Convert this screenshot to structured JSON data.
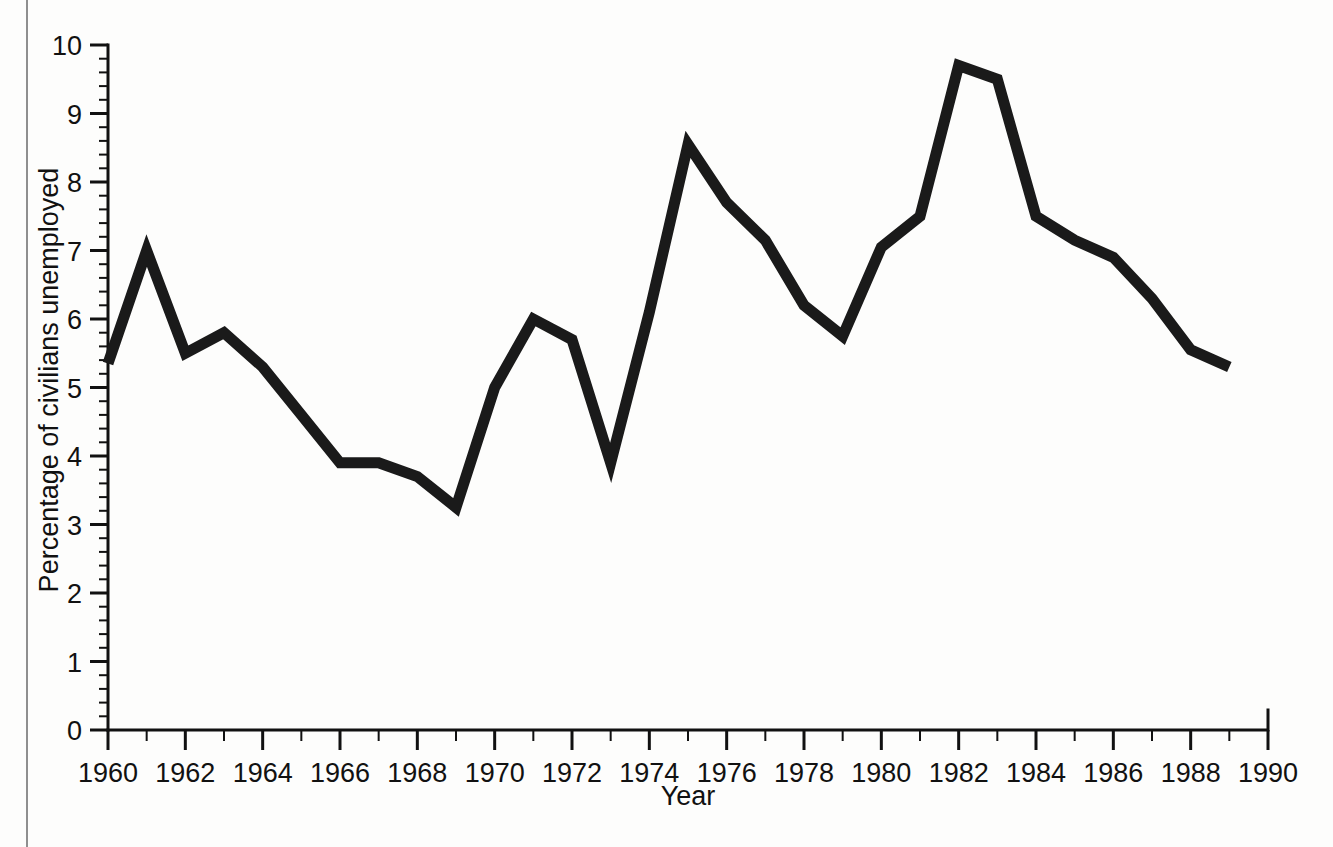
{
  "figure": {
    "background_color": "#fdfdfc",
    "line_color": "#1a1a1a",
    "axis_color": "#111111"
  },
  "chart_data": {
    "type": "line",
    "title": "",
    "xlabel": "Year",
    "ylabel": "Percentage of civilians unemployed",
    "xlim": [
      1960,
      1990
    ],
    "ylim": [
      0,
      10
    ],
    "grid": false,
    "legend": null,
    "x_major_ticks": [
      1960,
      1962,
      1964,
      1966,
      1968,
      1970,
      1972,
      1974,
      1976,
      1978,
      1980,
      1982,
      1984,
      1986,
      1988,
      1990
    ],
    "x_tick_labels": [
      "1960",
      "1962",
      "1964",
      "1966",
      "1968",
      "1970",
      "1972",
      "1974",
      "1976",
      "1978",
      "1980",
      "1982",
      "1984",
      "1986",
      "1988",
      "1990"
    ],
    "x_minor_tick_step": 1,
    "y_major_ticks": [
      0,
      1,
      2,
      3,
      4,
      5,
      6,
      7,
      8,
      9,
      10
    ],
    "y_tick_labels": [
      "0",
      "1",
      "2",
      "3",
      "4",
      "5",
      "6",
      "7",
      "8",
      "9",
      "10"
    ],
    "y_minor_tick_step": 0.2,
    "x": [
      1960,
      1961,
      1962,
      1963,
      1964,
      1965,
      1966,
      1967,
      1968,
      1969,
      1970,
      1971,
      1972,
      1973,
      1974,
      1975,
      1976,
      1977,
      1978,
      1979,
      1980,
      1981,
      1982,
      1983,
      1984,
      1985,
      1986,
      1987,
      1988,
      1989
    ],
    "values": [
      5.35,
      7.0,
      5.5,
      5.8,
      5.3,
      4.6,
      3.9,
      3.9,
      3.7,
      3.25,
      5.0,
      6.0,
      5.7,
      3.9,
      6.1,
      8.55,
      7.7,
      7.15,
      6.2,
      5.75,
      7.05,
      7.5,
      9.7,
      9.5,
      7.5,
      7.15,
      6.9,
      6.3,
      5.55,
      5.3
    ]
  }
}
